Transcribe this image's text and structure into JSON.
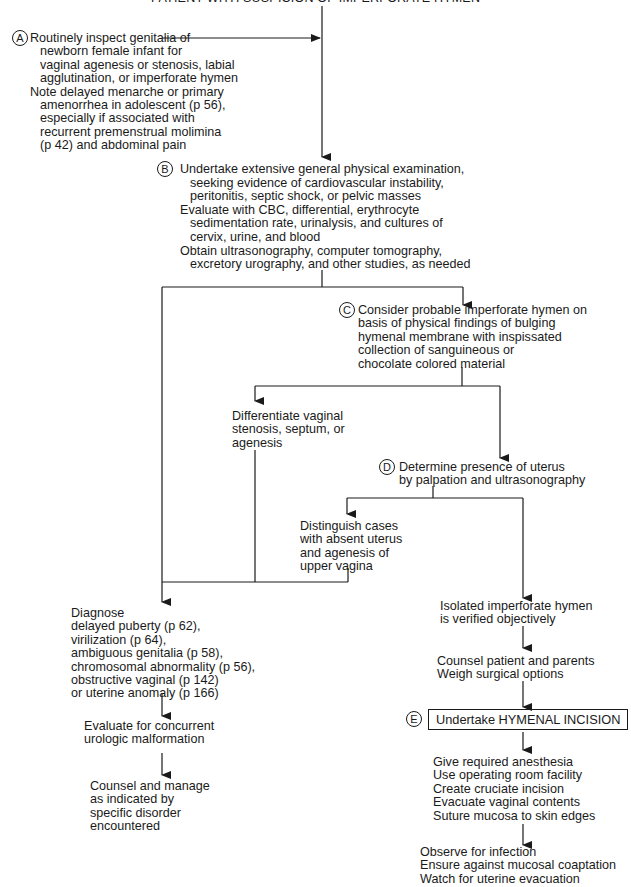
{
  "title": "PATIENT WITH SUSPICION OF IMPERFORATE HYMEN",
  "nodes": {
    "A": {
      "marker": "A",
      "lines": [
        "Routinely inspect genitalia of",
        "newborn female infant for",
        "vaginal agenesis or stenosis, labial",
        "agglutination, or imperforate hymen",
        "Note delayed menarche or primary",
        "amenorrhea in adolescent (p 56),",
        "especially if associated with",
        "recurrent premenstrual molimina",
        "(p 42) and abdominal pain"
      ]
    },
    "B": {
      "marker": "B",
      "lines": [
        "Undertake extensive general physical examination,",
        "seeking evidence of cardiovascular instability,",
        "peritonitis, septic shock, or pelvic masses",
        "Evaluate with CBC, differential, erythrocyte",
        "sedimentation rate, urinalysis, and cultures of",
        "cervix, urine, and blood",
        "Obtain ultrasonography, computer tomography,",
        "excretory urography, and other studies, as needed"
      ]
    },
    "C": {
      "marker": "C",
      "lines": [
        "Consider probable imperforate hymen on",
        "basis of physical findings of bulging",
        "hymenal membrane with inspissated",
        "collection of sanguineous or",
        "chocolate colored material"
      ]
    },
    "differentiate": {
      "lines": [
        "Differentiate vaginal",
        "stenosis, septum, or",
        "agenesis"
      ]
    },
    "D": {
      "marker": "D",
      "lines": [
        "Determine presence of uterus",
        "by palpation and ultrasonography"
      ]
    },
    "distinguish": {
      "lines": [
        "Distinguish cases",
        "with absent uterus",
        "and agenesis of",
        "upper vagina"
      ]
    },
    "diagnose": {
      "lines": [
        "Diagnose",
        "delayed puberty (p 62),",
        "virilization (p 64),",
        "ambiguous genitalia (p 58),",
        "chromosomal abnormality (p 56),",
        "obstructive vaginal (p 142)",
        "or uterine anomaly (p 166)"
      ]
    },
    "evaluate_urologic": {
      "lines": [
        "Evaluate for concurrent",
        "urologic malformation"
      ]
    },
    "counsel_manage": {
      "lines": [
        "Counsel and manage",
        "as indicated by",
        "specific disorder",
        "encountered"
      ]
    },
    "isolated": {
      "lines": [
        "Isolated imperforate hymen",
        "is verified objectively"
      ]
    },
    "counsel_patient": {
      "lines": [
        "Counsel patient and parents",
        "Weigh surgical options"
      ]
    },
    "E": {
      "marker": "E",
      "label": "Undertake HYMENAL INCISION"
    },
    "procedure": {
      "lines": [
        "Give required anesthesia",
        "Use operating room facility",
        "Create cruciate incision",
        "Evacuate vaginal contents",
        "Suture mucosa to skin edges"
      ]
    },
    "followup": {
      "lines": [
        "Observe for infection",
        "Ensure against mucosal coaptation",
        "Watch for uterine evacuation"
      ]
    }
  }
}
